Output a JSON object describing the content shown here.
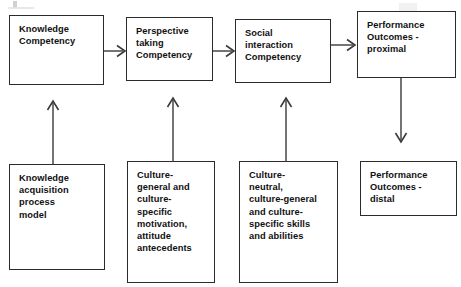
{
  "diagram": {
    "type": "flowchart",
    "title": "",
    "background_color": "#ffffff",
    "box_border_color": "#2b2b2b",
    "text_color": "#111111",
    "arrow_color": "#3a3a3a",
    "nodes": [
      {
        "id": "knowledge-competency",
        "label": "Knowledge\nCompetency",
        "row": "top",
        "column": 1
      },
      {
        "id": "perspective-taking-competency",
        "label": "Perspective\ntaking\nCompetency",
        "row": "top",
        "column": 2
      },
      {
        "id": "social-interaction-competency",
        "label": "Social\ninteraction\nCompetency",
        "row": "top",
        "column": 3
      },
      {
        "id": "performance-outcomes-proximal",
        "label": "Performance\nOutcomes -\nproximal",
        "row": "top",
        "column": 4
      },
      {
        "id": "knowledge-acquisition-process-model",
        "label": "Knowledge\nacquisition\nprocess\nmodel",
        "row": "bottom",
        "column": 1
      },
      {
        "id": "culture-general-specific-motivation",
        "label": "Culture-\ngeneral and\nculture-\nspecific\nmotivation,\nattitude\nantecedents",
        "row": "bottom",
        "column": 2
      },
      {
        "id": "culture-neutral-general-specific-skills",
        "label": "Culture-\nneutral,\nculture-general\nand culture-\nspecific skills\nand abilities",
        "row": "bottom",
        "column": 3
      },
      {
        "id": "performance-outcomes-distal",
        "label": "Performance\nOutcomes -\ndistal",
        "row": "bottom",
        "column": 4
      }
    ],
    "edges": [
      {
        "id": "edge-knowledge-to-perspective",
        "from": "knowledge-competency",
        "to": "perspective-taking-competency",
        "direction": "right"
      },
      {
        "id": "edge-perspective-to-social",
        "from": "perspective-taking-competency",
        "to": "social-interaction-competency",
        "direction": "right"
      },
      {
        "id": "edge-social-to-proximal",
        "from": "social-interaction-competency",
        "to": "performance-outcomes-proximal",
        "direction": "right"
      },
      {
        "id": "edge-acquisition-to-knowledge",
        "from": "knowledge-acquisition-process-model",
        "to": "knowledge-competency",
        "direction": "up"
      },
      {
        "id": "edge-motivation-to-perspective",
        "from": "culture-general-specific-motivation",
        "to": "perspective-taking-competency",
        "direction": "up"
      },
      {
        "id": "edge-skills-to-social",
        "from": "culture-neutral-general-specific-skills",
        "to": "social-interaction-competency",
        "direction": "up"
      },
      {
        "id": "edge-proximal-to-distal",
        "from": "performance-outcomes-proximal",
        "to": "performance-outcomes-distal",
        "direction": "down"
      }
    ]
  }
}
